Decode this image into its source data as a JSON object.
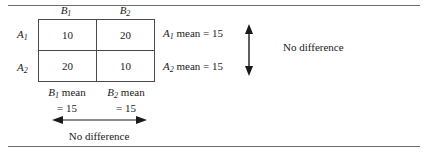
{
  "figure": {
    "type": "two-by-two-factorial-means-table",
    "rules": {
      "top": true,
      "bottom": true
    }
  },
  "matrix": {
    "column_headers": [
      {
        "base": "B",
        "subscript": "1",
        "text": "B1"
      },
      {
        "base": "B",
        "subscript": "2",
        "text": "B2"
      }
    ],
    "row_headers": [
      {
        "base": "A",
        "subscript": "1",
        "text": "A1"
      },
      {
        "base": "A",
        "subscript": "2",
        "text": "A2"
      }
    ],
    "cells": [
      [
        "10",
        "20"
      ],
      [
        "20",
        "10"
      ]
    ]
  },
  "row_means": [
    {
      "base": "A",
      "subscript": "1",
      "text": " mean = 15"
    },
    {
      "base": "A",
      "subscript": "2",
      "text": " mean = 15"
    }
  ],
  "column_means": [
    {
      "base": "B",
      "subscript": "1",
      "line1": " mean",
      "line2": "= 15"
    },
    {
      "base": "B",
      "subscript": "2",
      "line1": " mean",
      "line2": "= 15"
    }
  ],
  "annotations": {
    "rows_comparison": "No difference",
    "columns_comparison": "No difference"
  },
  "arrows": {
    "vertical": {
      "direction": "double",
      "orientation": "vertical"
    },
    "horizontal": {
      "direction": "double",
      "orientation": "horizontal"
    }
  },
  "colors": {
    "rule": "#6d6d6d",
    "border": "#4a4a4a",
    "text": "#1a1a1a",
    "background": "#ffffff"
  }
}
